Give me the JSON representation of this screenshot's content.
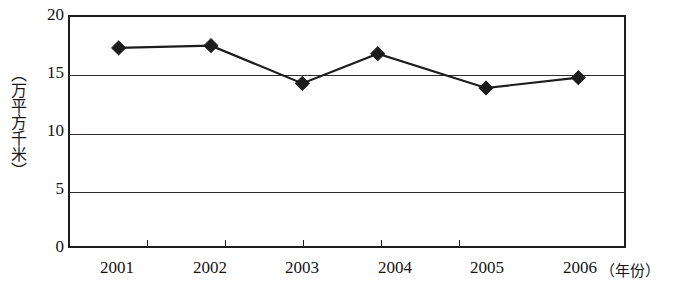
{
  "chart_data": {
    "type": "line",
    "title": "",
    "xlabel": "（年份）",
    "ylabel": "（万平方千米）",
    "categories": [
      "2001",
      "2002",
      "2003",
      "2004",
      "2005",
      "2006"
    ],
    "values": [
      17.3,
      17.5,
      14.2,
      16.8,
      13.8,
      14.7
    ],
    "series": [
      {
        "name": "",
        "values": [
          17.3,
          17.5,
          14.2,
          16.8,
          13.8,
          14.7
        ]
      }
    ],
    "ylim": [
      0,
      20
    ],
    "yticks": [
      0,
      5,
      10,
      15,
      20
    ],
    "ytick_labels": [
      "0",
      "5",
      "10",
      "15",
      "20"
    ],
    "grid": true,
    "grid_axis": "y",
    "legend": "none",
    "marker": "diamond",
    "line_color": "#1c1c1c",
    "marker_color": "#1c1c1c",
    "background_color": "#ffffff"
  },
  "axes": {
    "y_unit_label": "（万平方千米）",
    "x_unit_label": "（年份）",
    "y_tick_0": "0",
    "y_tick_1": "5",
    "y_tick_2": "10",
    "y_tick_3": "15",
    "y_tick_4": "20",
    "x_tick_0": "2001",
    "x_tick_1": "2002",
    "x_tick_2": "2003",
    "x_tick_3": "2004",
    "x_tick_4": "2005",
    "x_tick_5": "2006"
  }
}
